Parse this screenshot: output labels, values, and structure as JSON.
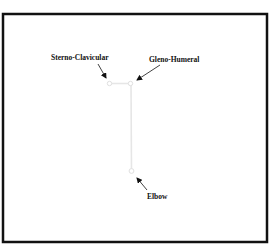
{
  "diagram": {
    "title": "",
    "frame": {
      "x": 3,
      "y": 14,
      "width": 264,
      "height": 228,
      "stroke": "#111111"
    },
    "bone_color": "#e6e6e6",
    "arrow_color": "#111111",
    "joints": [
      {
        "id": "sterno-clavicular",
        "label": "Sterno-Clavicular",
        "x": 109.5,
        "y": 83.5
      },
      {
        "id": "gleno-humeral",
        "label": "Gleno-Humeral",
        "x": 130.5,
        "y": 83.5
      },
      {
        "id": "elbow",
        "label": "Elbow",
        "x": 131.5,
        "y": 171
      }
    ],
    "segments": [
      {
        "id": "clavicle",
        "from": "sterno-clavicular",
        "to": "gleno-humeral"
      },
      {
        "id": "humerus",
        "from": "gleno-humeral",
        "to": "elbow"
      }
    ],
    "labels": {
      "sterno_clavicular": "Sterno-Clavicular",
      "gleno_humeral": "Gleno-Humeral",
      "elbow": "Elbow"
    }
  }
}
